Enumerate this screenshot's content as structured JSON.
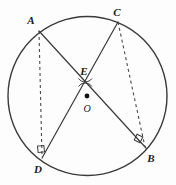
{
  "figure": {
    "kind": "circle-geometry-diagram",
    "canvas": {
      "width": 176,
      "height": 185,
      "background": "#fdfdfd"
    },
    "colors": {
      "stroke": "#3a3a3a",
      "dashed_stroke": "#4a4a4a",
      "label_text": "#1a1a1a",
      "center_dot": "#111111"
    },
    "circle": {
      "name": "main-circle",
      "cx": 87.5,
      "cy": 96,
      "r": 79.5,
      "stroke_width": 1.4
    },
    "points": [
      {
        "id": "A",
        "label": "A",
        "x": 39,
        "y": 31,
        "label_x": 31,
        "label_y": 20
      },
      {
        "id": "C",
        "label": "C",
        "x": 118,
        "y": 22,
        "label_x": 117,
        "label_y": 12
      },
      {
        "id": "E",
        "label": "E",
        "x": 85,
        "y": 82,
        "label_x": 84,
        "label_y": 71
      },
      {
        "id": "O",
        "label": "O",
        "x": 87,
        "y": 96,
        "label_x": 87,
        "label_y": 109
      },
      {
        "id": "D",
        "label": "D",
        "x": 42,
        "y": 158,
        "label_x": 38,
        "label_y": 169
      },
      {
        "id": "B",
        "label": "B",
        "x": 146,
        "y": 148,
        "label_x": 151,
        "label_y": 158
      }
    ],
    "chords": [
      {
        "name": "chord-AB",
        "from": "A",
        "to": "B",
        "style": "solid",
        "x1": 39,
        "y1": 31,
        "x2": 146,
        "y2": 148
      },
      {
        "name": "chord-CD",
        "from": "C",
        "to": "D",
        "style": "solid",
        "x1": 118,
        "y1": 22,
        "x2": 42,
        "y2": 158
      }
    ],
    "dashed_segments": [
      {
        "name": "segment-AD",
        "from": "A",
        "to": "D",
        "style": "dashed",
        "x1": 39,
        "y1": 31,
        "x2": 42,
        "y2": 157,
        "dash": "3,3"
      },
      {
        "name": "segment-CB",
        "from": "C",
        "to": "B",
        "style": "dashed",
        "x1": 118,
        "y1": 22,
        "x2": 145,
        "y2": 147,
        "dash": "3,3"
      }
    ],
    "right_angle_marks": [
      {
        "name": "right-angle-at-D",
        "at": "D",
        "x": 41,
        "y": 149,
        "size": 6,
        "rotation": -8
      },
      {
        "name": "right-angle-at-B",
        "at": "B",
        "x": 138,
        "y": 138,
        "size": 6,
        "rotation": 24
      }
    ],
    "angle_arcs": [
      {
        "name": "angle-arc-upper-E",
        "at": "E",
        "position": "above",
        "cx": 85,
        "cy": 82,
        "r": 8
      },
      {
        "name": "angle-arc-lower-E",
        "at": "E",
        "position": "below",
        "cx": 85,
        "cy": 82,
        "r": 8
      }
    ],
    "center_dot": {
      "name": "center-point-O",
      "cx": 87,
      "cy": 96,
      "r": 2.3
    }
  }
}
